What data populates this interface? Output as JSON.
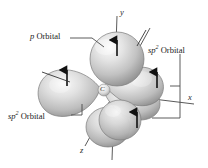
{
  "figure": {
    "background_color": "#ffffff",
    "labels": {
      "p_orbital": {
        "prefix": "p",
        "text": " Orbital"
      },
      "sp2_orbital_right": {
        "prefix": "sp",
        "sup": "2",
        "text": " Orbital"
      },
      "sp2_orbital_left": {
        "prefix": "sp",
        "sup": "2",
        "text": " Orbital"
      }
    },
    "axes": {
      "y": "y",
      "x": "x",
      "z": "z"
    },
    "atom": {
      "symbol": "C"
    },
    "colors": {
      "sphere_light": "#f2f2f2",
      "sphere_mid": "#c9c9c9",
      "sphere_dark": "#8e8e8e",
      "outline": "#6f6f6f",
      "arrow": "#111111",
      "axis": "#555555",
      "leader": "#4a4a4a",
      "text": "#1a1a1a"
    },
    "orbitals": [
      {
        "name": "p-orbital-top",
        "kind": "p",
        "arrow": "up",
        "shape": "sphere"
      },
      {
        "name": "sp2-orbital-left",
        "kind": "sp2",
        "arrow": "up",
        "shape": "teardrop"
      },
      {
        "name": "sp2-orbital-right",
        "kind": "sp2",
        "arrow": "up",
        "shape": "teardrop"
      },
      {
        "name": "sp2-orbital-bottom",
        "kind": "sp2",
        "arrow": "up",
        "shape": "teardrop"
      },
      {
        "name": "p-orbital-bottom-lobe",
        "kind": "p",
        "arrow": "none",
        "shape": "sphere"
      }
    ]
  }
}
